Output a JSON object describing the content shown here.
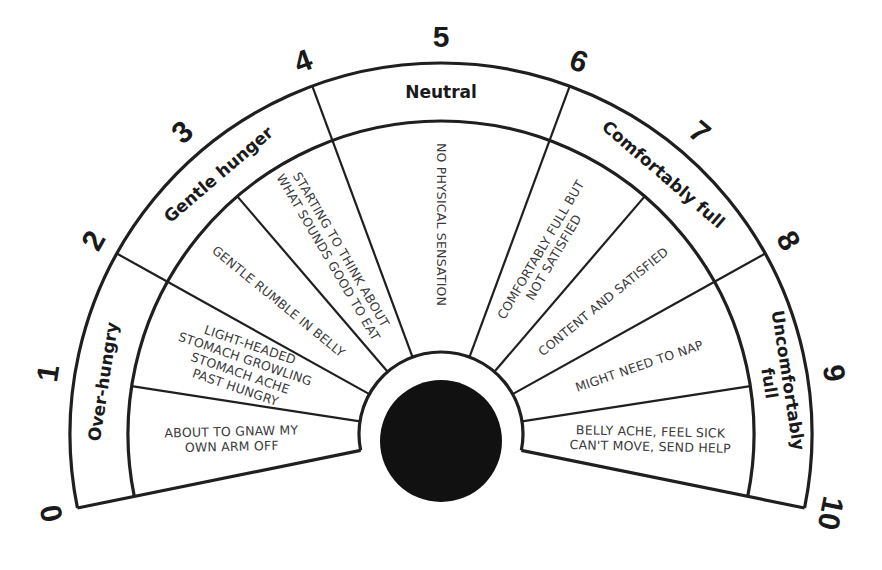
{
  "diagram": {
    "title": "Hunger and fullness scale",
    "geometry": {
      "cx": 441,
      "cy": 434,
      "outer_r": 371,
      "band_r": 313,
      "hub_r": 82,
      "hub_disk": {
        "cx": 441,
        "cy": 441,
        "r": 61
      },
      "start_deg": 191.5,
      "end_deg": -11.5,
      "number_r": 398
    },
    "colors": {
      "line": "#1f1f1f",
      "hub": "#111111",
      "background": "#ffffff",
      "text": "#1a1a1a",
      "description_text": "#3a3a3a"
    },
    "scale_numbers": [
      "0",
      "1",
      "2",
      "3",
      "4",
      "5",
      "6",
      "7",
      "8",
      "9",
      "10"
    ],
    "zones": [
      {
        "label": "Over-hungry",
        "from": 0,
        "to": 2
      },
      {
        "label": "Gentle hunger",
        "from": 2,
        "to": 4
      },
      {
        "label": "Neutral",
        "from": 4,
        "to": 6
      },
      {
        "label": "Comfortably full",
        "from": 6,
        "to": 8
      },
      {
        "label": "Uncomfortably full",
        "lines": [
          "Uncomfortably",
          "full"
        ],
        "from": 8,
        "to": 10
      }
    ],
    "descriptions": [
      {
        "from": 0,
        "to": 1,
        "lines": [
          "ABOUT TO GNAW MY",
          "OWN ARM OFF"
        ]
      },
      {
        "from": 1,
        "to": 2,
        "lines": [
          "LIGHT-HEADED",
          "STOMACH GROWLING",
          "STOMACH ACHE",
          "PAST HUNGRY"
        ]
      },
      {
        "from": 2,
        "to": 3,
        "lines": [
          "GENTLE RUMBLE IN BELLY"
        ]
      },
      {
        "from": 3,
        "to": 4,
        "lines": [
          "STARTING TO THINK ABOUT",
          "WHAT SOUNDS GOOD TO EAT"
        ]
      },
      {
        "from": 4,
        "to": 6,
        "lines": [
          "NO PHYSICAL SENSATION"
        ]
      },
      {
        "from": 6,
        "to": 7,
        "lines": [
          "COMFORTABLY FULL BUT",
          "NOT SATISFIED"
        ]
      },
      {
        "from": 7,
        "to": 8,
        "lines": [
          "CONTENT AND SATISFIED"
        ]
      },
      {
        "from": 8,
        "to": 9,
        "lines": [
          "MIGHT NEED TO NAP"
        ]
      },
      {
        "from": 9,
        "to": 10,
        "lines": [
          "BELLY ACHE, FEEL SICK",
          "CAN'T MOVE, SEND HELP"
        ]
      }
    ]
  }
}
